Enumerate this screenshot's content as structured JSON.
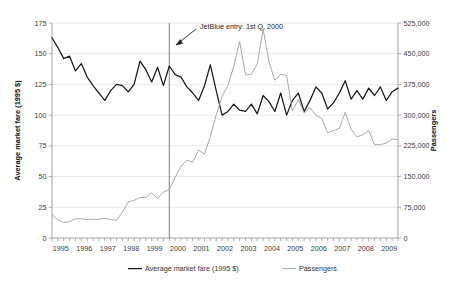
{
  "chart_data": {
    "type": "line",
    "title": "",
    "xlabel": "",
    "ylabel": "Average market fare (1995 $)",
    "y2label": "Passengers",
    "grid": true,
    "legend_position": "bottom",
    "x_tick_labels": [
      "1995",
      "1996",
      "1997",
      "1998",
      "1999",
      "2000",
      "2001",
      "2002",
      "2003",
      "2004",
      "2005",
      "2006",
      "2007",
      "2008",
      "2009"
    ],
    "x_ticks_per_label": 4,
    "x_minor_ticks": "quarterly",
    "xlim": [
      1995.0,
      2009.75
    ],
    "ylim": [
      0,
      175
    ],
    "y_tick_labels": [
      "0",
      "25",
      "50",
      "75",
      "100",
      "125",
      "150",
      "175"
    ],
    "y_ticks": [
      0,
      25,
      50,
      75,
      100,
      125,
      150,
      175
    ],
    "y2lim": [
      0,
      525000
    ],
    "y2_tick_labels": [
      "0",
      "75,000",
      "150,000",
      "225,000",
      "300,000",
      "375,000",
      "450,000",
      "525,000"
    ],
    "y2_ticks": [
      0,
      75000,
      150000,
      225000,
      300000,
      375000,
      450000,
      525000
    ],
    "x": [
      "1995 Q1",
      "1995 Q2",
      "1995 Q3",
      "1995 Q4",
      "1996 Q1",
      "1996 Q2",
      "1996 Q3",
      "1996 Q4",
      "1997 Q1",
      "1997 Q2",
      "1997 Q3",
      "1997 Q4",
      "1998 Q1",
      "1998 Q2",
      "1998 Q3",
      "1998 Q4",
      "1999 Q1",
      "1999 Q2",
      "1999 Q3",
      "1999 Q4",
      "2000 Q1",
      "2000 Q2",
      "2000 Q3",
      "2000 Q4",
      "2001 Q1",
      "2001 Q2",
      "2001 Q3",
      "2001 Q4",
      "2002 Q1",
      "2002 Q2",
      "2002 Q3",
      "2002 Q4",
      "2003 Q1",
      "2003 Q2",
      "2003 Q3",
      "2003 Q4",
      "2004 Q1",
      "2004 Q2",
      "2004 Q3",
      "2004 Q4",
      "2005 Q1",
      "2005 Q2",
      "2005 Q3",
      "2005 Q4",
      "2006 Q1",
      "2006 Q2",
      "2006 Q3",
      "2006 Q4",
      "2007 Q1",
      "2007 Q2",
      "2007 Q3",
      "2007 Q4",
      "2008 Q1",
      "2008 Q2",
      "2008 Q3",
      "2008 Q4",
      "2009 Q1",
      "2009 Q2",
      "2009 Q3",
      "2009 Q4"
    ],
    "series": [
      {
        "name": "Average market fare (1995 $)",
        "axis": "left",
        "color": "#1a1a1a",
        "values": [
          163,
          155,
          146,
          148,
          136,
          142,
          131,
          124,
          118,
          112,
          120,
          125,
          124,
          119,
          125,
          144,
          137,
          127,
          139,
          124,
          140,
          133,
          131,
          123,
          118,
          112,
          124,
          141,
          120,
          100,
          103,
          109,
          104,
          103,
          109,
          101,
          116,
          111,
          103,
          118,
          100,
          112,
          118,
          103,
          112,
          123,
          118,
          105,
          110,
          118,
          128,
          113,
          120,
          113,
          122,
          116,
          123,
          112,
          119,
          122
        ]
      },
      {
        "name": "Passengers",
        "axis": "right",
        "color": "#9a9a9a",
        "values": [
          57000,
          44000,
          38000,
          40000,
          47000,
          47000,
          45000,
          46000,
          46000,
          48000,
          45000,
          43000,
          63000,
          88000,
          92000,
          99000,
          99000,
          110000,
          97000,
          112000,
          118000,
          148000,
          175000,
          190000,
          185000,
          215000,
          205000,
          248000,
          300000,
          345000,
          372000,
          420000,
          480000,
          398000,
          400000,
          425000,
          510000,
          430000,
          385000,
          400000,
          397000,
          310000,
          338000,
          305000,
          318000,
          300000,
          292000,
          257000,
          262000,
          268000,
          307000,
          265000,
          247000,
          252000,
          262000,
          228000,
          228000,
          232000,
          242000,
          240000
        ]
      }
    ],
    "annotations": [
      {
        "name": "jetblue-entry",
        "text": "JetBlue entry: 1st Q, 2000",
        "marker_x": "2000 Q1",
        "marker_type": "vertical-line",
        "marker_color": "#808080"
      }
    ],
    "legend": [
      {
        "label": "Average market fare (1995 $)",
        "color": "#1a1a1a"
      },
      {
        "label": "Passengers",
        "color": "#9a9a9a"
      }
    ],
    "border_color": "#9a9a9a",
    "grid_color": "#d8d8d8",
    "background": "#ffffff"
  }
}
